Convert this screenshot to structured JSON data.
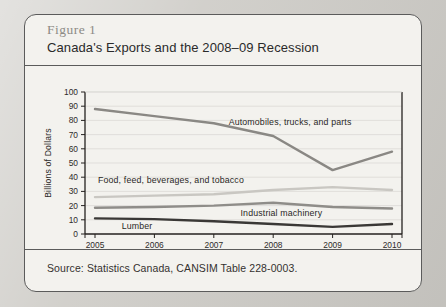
{
  "figure": {
    "number_label": "Figure 1",
    "title": "Canada's Exports and the 2008–09 Recession",
    "source": "Source: Statistics Canada, CANSIM Table 228-0003."
  },
  "colors": {
    "panel_background": "#f3f2ee",
    "panel_border": "#5b5b5b",
    "page_background": "#c9c7c2",
    "axis": "#24211f",
    "gridline": "#d9d7d2",
    "automobiles": "#8a8884",
    "food": "#c9c7c2",
    "machinery": "#8f8d89",
    "lumber": "#3a3836"
  },
  "chart_data": {
    "type": "line",
    "title": "Canada's Exports and the 2008–09 Recession",
    "xlabel": "",
    "ylabel": "Billions of Dollars",
    "categories": [
      "2005",
      "2006",
      "2007",
      "2008",
      "2009",
      "2010"
    ],
    "x": [
      2005,
      2006,
      2007,
      2008,
      2009,
      2010
    ],
    "ylim": [
      0,
      100
    ],
    "yticks": [
      0,
      10,
      20,
      30,
      40,
      50,
      60,
      70,
      80,
      90,
      100
    ],
    "grid": true,
    "legend": "inline-labels",
    "series": [
      {
        "name": "Automobiles, trucks, and parts",
        "color": "#8a8884",
        "width": 2.4,
        "values": [
          88,
          83,
          78,
          69,
          45,
          58
        ],
        "label_x": 2007.25,
        "label_y": 79
      },
      {
        "name": "Food, feed, beverages, and tobacco",
        "color": "#c9c7c2",
        "width": 2.4,
        "values": [
          26,
          27,
          28,
          31,
          33,
          31
        ],
        "label_x": 2005.05,
        "label_y": 38
      },
      {
        "name": "Industrial machinery",
        "color": "#8f8d89",
        "width": 2.4,
        "values": [
          18.5,
          19,
          20,
          22,
          19,
          18
        ],
        "label_x": 2007.45,
        "label_y": 15
      },
      {
        "name": "Lumber",
        "color": "#3a3836",
        "width": 2.4,
        "values": [
          11,
          10.5,
          9,
          7,
          5,
          7
        ],
        "label_x": 2005.45,
        "label_y": 5.5
      }
    ]
  }
}
